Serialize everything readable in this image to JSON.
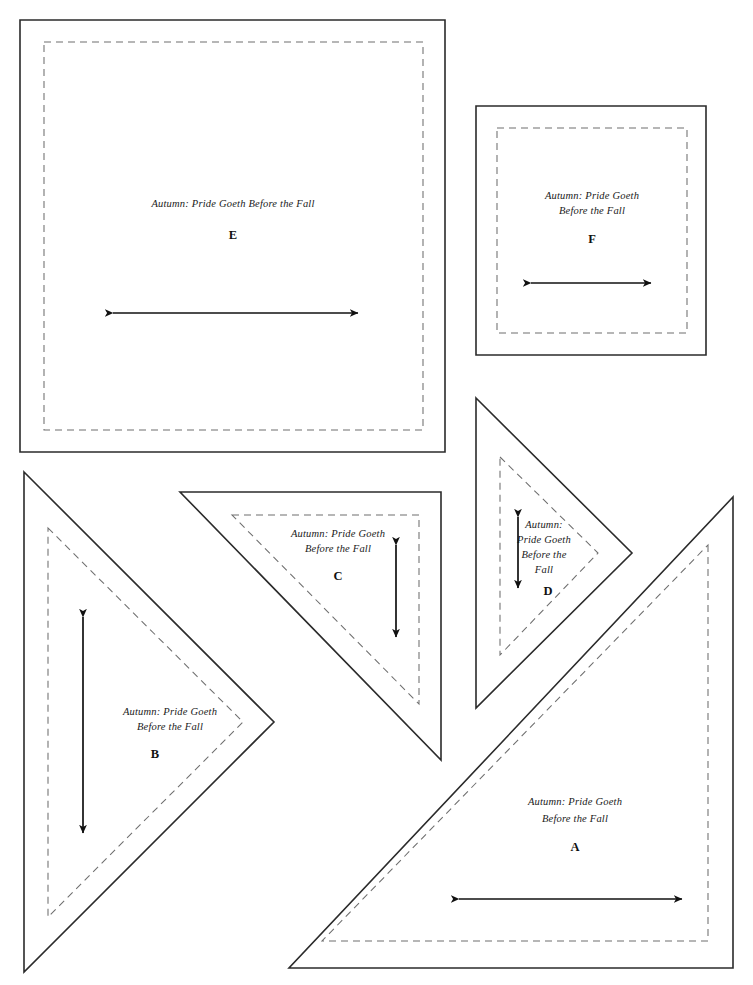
{
  "document": {
    "title": "Quilt Pattern Templates",
    "pattern_name": "Autumn: Pride Goeth Before the Fall",
    "page_width": 753,
    "page_height": 985,
    "background_color": "#ffffff",
    "cut_line_color": "#2b2b2b",
    "seam_line_color": "#6e6e6e",
    "arrow_color": "#111111",
    "text_color": "#1a1a1a"
  },
  "pieces": {
    "e": {
      "letter": "E",
      "shape": "square",
      "text_lines": [
        "Autumn: Pride Goeth Before the Fall"
      ],
      "line1": "Autumn: Pride Goeth Before the Fall",
      "grain_direction": "horizontal",
      "cut_outline": "20,20 445,20 445,452 20,452",
      "seam_outline": "44,42 423,42 423,430 44,430",
      "letter_x": 233,
      "letter_y": 239,
      "text_x": 233,
      "text_y": 207
    },
    "f": {
      "letter": "F",
      "shape": "square",
      "text_lines": [
        "Autumn: Pride Goeth",
        "Before the Fall"
      ],
      "line1": "Autumn: Pride Goeth",
      "line2": "Before the Fall",
      "grain_direction": "horizontal",
      "cut_outline": "476,106 706,106 706,355 476,355",
      "seam_outline": "497,128 687,128 687,333 497,333",
      "letter_x": 592,
      "letter_y": 243,
      "text_x": 592,
      "text_y": 199
    },
    "a": {
      "letter": "A",
      "shape": "right-triangle",
      "text_lines": [
        "Autumn: Pride Goeth",
        "Before the Fall"
      ],
      "line1": "Autumn: Pride Goeth",
      "line2": "Before the Fall",
      "grain_direction": "horizontal",
      "cut_outline": "733,497 733,968 289,968",
      "seam_outline": "708,545 708,941 322,941",
      "letter_x": 575,
      "letter_y": 851,
      "text_x": 575,
      "text_y": 805
    },
    "b": {
      "letter": "B",
      "shape": "right-triangle",
      "text_lines": [
        "Autumn: Pride Goeth",
        "Before the Fall"
      ],
      "line1": "Autumn: Pride Goeth",
      "line2": "Before the Fall",
      "grain_direction": "vertical",
      "cut_outline": "24,472 274,722 24,972",
      "seam_outline": "48,528 243,722 48,917",
      "letter_x": 155,
      "letter_y": 758,
      "text_x": 170,
      "text_y": 715
    },
    "c": {
      "letter": "C",
      "shape": "right-triangle",
      "text_lines": [
        "Autumn: Pride Goeth",
        "Before the Fall"
      ],
      "line1": "Autumn: Pride Goeth",
      "line2": "Before the Fall",
      "grain_direction": "vertical",
      "cut_outline": "180,492 441,492 441,760",
      "seam_outline": "232,515 419,515 419,704",
      "letter_x": 338,
      "letter_y": 580,
      "text_x": 338,
      "text_y": 537
    },
    "d": {
      "letter": "D",
      "shape": "right-triangle",
      "text_lines": [
        "Autumn:",
        "Pride Goeth",
        "Before the",
        "Fall"
      ],
      "line1": "Autumn:",
      "line2": "Pride Goeth",
      "line3": "Before the",
      "line4": "Fall",
      "grain_direction": "vertical",
      "cut_outline": "476,398 632,553 476,708",
      "seam_outline": "500,457 598,553 500,655",
      "letter_x": 548,
      "letter_y": 595,
      "text_x": 544,
      "text_y": 528
    }
  },
  "grain_arrows": {
    "e": {
      "type": "horizontal-double-arrow",
      "x1": 113,
      "x2": 358,
      "y": 313
    },
    "f": {
      "type": "horizontal-double-arrow",
      "x1": 531,
      "x2": 651,
      "y": 283
    },
    "a": {
      "type": "horizontal-double-arrow",
      "x1": 459,
      "x2": 682,
      "y": 899
    },
    "b": {
      "type": "vertical-double-arrow",
      "y1": 617,
      "y2": 833,
      "x": 83
    },
    "c": {
      "type": "vertical-double-arrow",
      "y1": 545,
      "y2": 637,
      "x": 396
    },
    "d": {
      "type": "vertical-double-arrow",
      "y1": 517,
      "y2": 588,
      "x": 518
    }
  }
}
